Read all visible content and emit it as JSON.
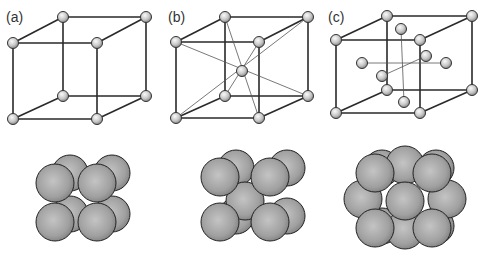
{
  "figure": {
    "panels": [
      {
        "label": "(a)",
        "structure": "simple cubic",
        "lattice_atoms": 8
      },
      {
        "label": "(b)",
        "structure": "body-centered cubic",
        "lattice_atoms": 9
      },
      {
        "label": "(c)",
        "structure": "face-centered cubic",
        "lattice_atoms": 14
      }
    ],
    "colors": {
      "line": "#2a2a2a",
      "atom_fill": "#bdbdbd",
      "atom_highlight": "#f2f2f2",
      "sphere_fill": "#9a9a9a",
      "background": "#ffffff"
    }
  }
}
